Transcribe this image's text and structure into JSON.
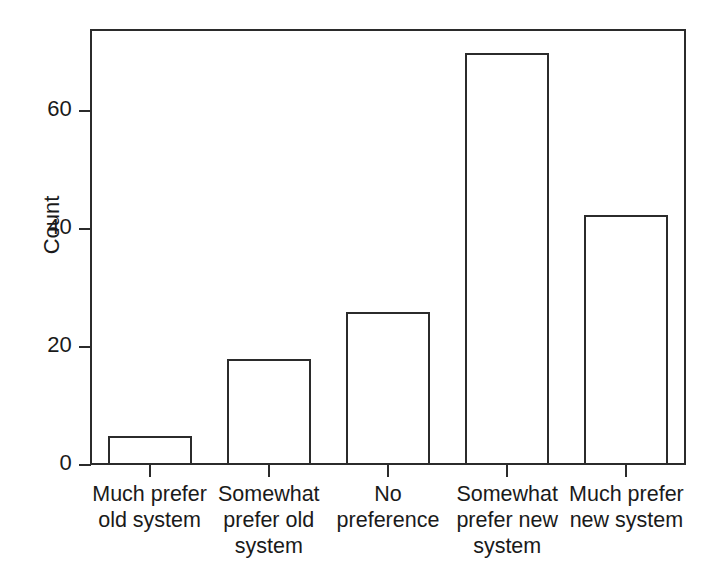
{
  "chart_data": {
    "type": "bar",
    "title": "",
    "xlabel": "",
    "ylabel": "Count",
    "categories": [
      "Much prefer old system",
      "Somewhat prefer old system",
      "No preference",
      "Somewhat prefer new system",
      "Much prefer new system"
    ],
    "values": [
      5,
      18,
      26,
      70,
      42.5
    ],
    "ylim": [
      0,
      74
    ],
    "yticks": [
      0,
      20,
      40,
      60
    ],
    "ytick_labels": [
      "0",
      "20",
      "40",
      "60"
    ],
    "grid": false,
    "legend": false,
    "legend_position": "none",
    "bar_facecolor": "#ffffff",
    "bar_edgecolor": "#2b2b2b",
    "frame_color": "#2b2b2b",
    "background": "#ffffff"
  },
  "axis": {
    "y_title": "Count",
    "tick_labels": [
      "0",
      "20",
      "40",
      "60"
    ]
  },
  "categories": [
    {
      "line1": "Much prefer",
      "line2": "old system",
      "line3": ""
    },
    {
      "line1": "Somewhat",
      "line2": "prefer old",
      "line3": "system"
    },
    {
      "line1": "No preference",
      "line2": "",
      "line3": ""
    },
    {
      "line1": "Somewhat",
      "line2": "prefer new",
      "line3": "system"
    },
    {
      "line1": "Much prefer",
      "line2": "new system",
      "line3": ""
    }
  ]
}
